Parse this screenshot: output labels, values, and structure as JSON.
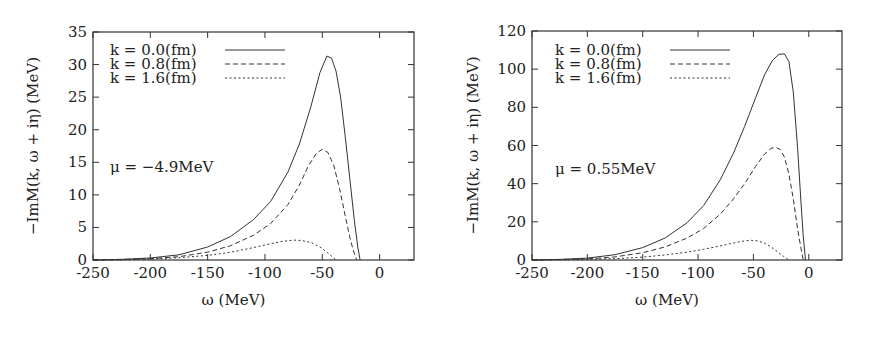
{
  "chart_data": [
    {
      "type": "line",
      "title": "",
      "xlabel": "ω (MeV)",
      "ylabel": "−ImM(k, ω + iη) (MeV)",
      "xlim": [
        -250,
        30
      ],
      "ylim": [
        0,
        35
      ],
      "xticks": [
        -250,
        -200,
        -150,
        -100,
        -50,
        0
      ],
      "yticks": [
        0,
        5,
        10,
        15,
        20,
        25,
        30,
        35
      ],
      "grid": false,
      "legend_position": "top-left",
      "annotation": "μ = −4.9MeV",
      "series": [
        {
          "name": "k = 0.0(fm)",
          "style": "solid",
          "x": [
            -250,
            -225,
            -200,
            -175,
            -150,
            -130,
            -110,
            -95,
            -80,
            -70,
            -60,
            -52,
            -46,
            -42,
            -38,
            -34,
            -30,
            -26,
            -22,
            -19,
            -17
          ],
          "y": [
            0,
            0.1,
            0.3,
            0.8,
            2.0,
            3.6,
            6.2,
            9.0,
            13.5,
            17.8,
            23.5,
            28.8,
            31.3,
            31.0,
            29.0,
            25.0,
            19.0,
            12.5,
            6.0,
            2.0,
            0
          ]
        },
        {
          "name": "k = 0.8(fm)",
          "style": "dashed",
          "x": [
            -250,
            -225,
            -200,
            -175,
            -150,
            -130,
            -110,
            -95,
            -80,
            -70,
            -62,
            -55,
            -50,
            -45,
            -40,
            -35,
            -30,
            -26,
            -23,
            -20
          ],
          "y": [
            0,
            0.05,
            0.2,
            0.5,
            1.2,
            2.2,
            3.8,
            5.6,
            8.5,
            11.5,
            14.5,
            16.4,
            17.0,
            16.5,
            14.5,
            11.0,
            6.8,
            3.5,
            1.5,
            0
          ]
        },
        {
          "name": "k = 1.6(fm)",
          "style": "dotted",
          "x": [
            -250,
            -225,
            -200,
            -175,
            -150,
            -130,
            -110,
            -95,
            -85,
            -75,
            -68,
            -60,
            -52,
            -46,
            -42,
            -38
          ],
          "y": [
            0,
            0.05,
            0.15,
            0.35,
            0.7,
            1.2,
            1.9,
            2.5,
            2.85,
            3.05,
            3.0,
            2.7,
            2.0,
            1.2,
            0.6,
            0
          ]
        }
      ]
    },
    {
      "type": "line",
      "title": "",
      "xlabel": "ω (MeV)",
      "ylabel": "−ImM(k, ω + iη) (MeV)",
      "xlim": [
        -250,
        30
      ],
      "ylim": [
        0,
        120
      ],
      "xticks": [
        -250,
        -200,
        -150,
        -100,
        -50,
        0
      ],
      "yticks": [
        0,
        20,
        40,
        60,
        80,
        100,
        120
      ],
      "grid": false,
      "legend_position": "top-left",
      "annotation": "μ = 0.55MeV",
      "series": [
        {
          "name": "k = 0.0(fm)",
          "style": "solid",
          "x": [
            -250,
            -225,
            -200,
            -175,
            -150,
            -130,
            -110,
            -95,
            -80,
            -68,
            -58,
            -48,
            -40,
            -33,
            -27,
            -22,
            -18,
            -14,
            -10,
            -7,
            -5,
            -3
          ],
          "y": [
            0,
            0.3,
            1.0,
            2.8,
            6.5,
            11.5,
            19.5,
            28.5,
            42.0,
            56.0,
            70.0,
            85.0,
            97.0,
            104.5,
            107.8,
            108.0,
            104.0,
            88.0,
            58.0,
            30.0,
            12.0,
            0
          ]
        },
        {
          "name": "k = 0.8(fm)",
          "style": "dashed",
          "x": [
            -250,
            -225,
            -200,
            -175,
            -150,
            -130,
            -110,
            -95,
            -80,
            -68,
            -58,
            -48,
            -40,
            -34,
            -30,
            -26,
            -22,
            -18,
            -14,
            -10,
            -7,
            -5
          ],
          "y": [
            0,
            0.2,
            0.6,
            1.6,
            3.8,
            6.8,
            11.5,
            16.5,
            24.0,
            32.0,
            40.0,
            49.0,
            55.5,
            58.5,
            59.0,
            58.0,
            54.0,
            45.0,
            32.0,
            16.0,
            6.0,
            0
          ]
        },
        {
          "name": "k = 1.6(fm)",
          "style": "dotted",
          "x": [
            -250,
            -225,
            -200,
            -175,
            -150,
            -130,
            -110,
            -95,
            -80,
            -68,
            -58,
            -52,
            -46,
            -40,
            -34,
            -28,
            -23,
            -18
          ],
          "y": [
            0,
            0.1,
            0.3,
            0.7,
            1.5,
            2.6,
            4.1,
            5.6,
            7.4,
            8.9,
            10.0,
            10.3,
            10.0,
            8.8,
            6.8,
            4.2,
            2.0,
            0
          ]
        }
      ]
    }
  ]
}
